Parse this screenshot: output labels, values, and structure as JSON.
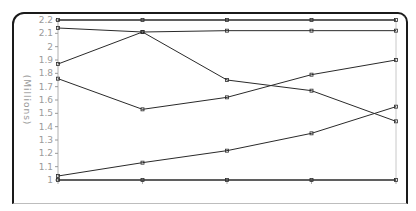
{
  "chart_data": {
    "type": "line",
    "title": "",
    "xlabel": "",
    "ylabel": "(Millions)",
    "ylim": [
      1.0,
      2.2
    ],
    "yticks": [
      1,
      1.1,
      1.2,
      1.3,
      1.4,
      1.5,
      1.6,
      1.7,
      1.8,
      1.9,
      2,
      2.1,
      2.2
    ],
    "ytick_labels": [
      "1",
      "1.1",
      "1.2",
      "1.3",
      "1.4",
      "1.5",
      "1.6",
      "1.7",
      "1.8",
      "1.9",
      "2",
      "2.1",
      "2.2"
    ],
    "x": [
      1,
      2,
      3,
      4,
      5
    ],
    "xtick_labels": [],
    "grid": false,
    "legend": null,
    "series": [
      {
        "name": "Series 1",
        "values": [
          2.2,
          2.2,
          2.2,
          2.2,
          2.2
        ]
      },
      {
        "name": "Series 2",
        "values": [
          2.14,
          2.11,
          2.12,
          2.12,
          2.12
        ]
      },
      {
        "name": "Series 3",
        "values": [
          1.87,
          2.11,
          1.75,
          1.67,
          1.44
        ]
      },
      {
        "name": "Series 4",
        "values": [
          1.76,
          1.53,
          1.62,
          1.79,
          1.9
        ]
      },
      {
        "name": "Series 5",
        "values": [
          1.03,
          1.13,
          1.22,
          1.35,
          1.55
        ]
      },
      {
        "name": "Series 6",
        "values": [
          1.0,
          1.0,
          1.0,
          1.0,
          1.0
        ]
      }
    ],
    "line_color": "#2a2a2a"
  }
}
